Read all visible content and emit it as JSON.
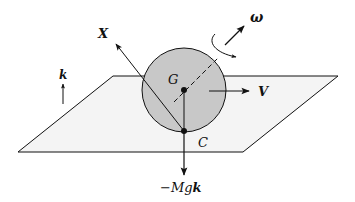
{
  "diagram": {
    "colors": {
      "plane_fill": "#f4f4f4",
      "sphere_fill": "#c8c8c8",
      "stroke": "#111111",
      "background": "#ffffff"
    },
    "labels": {
      "x_axis": "X",
      "omega": "ω",
      "velocity": "V",
      "center": "G",
      "contact": "C",
      "k_vector": "k",
      "weight_prefix": "−Mg",
      "weight_vector": "k"
    },
    "elements": [
      {
        "name": "plane",
        "type": "parallelogram"
      },
      {
        "name": "sphere",
        "type": "circle",
        "center_label": "G"
      },
      {
        "name": "contact-point",
        "label": "C"
      },
      {
        "name": "X-axis-arrow",
        "label": "X"
      },
      {
        "name": "rotation-axis",
        "style": "dashed"
      },
      {
        "name": "angular-velocity-arrow",
        "label": "ω"
      },
      {
        "name": "velocity-arrow",
        "label": "V"
      },
      {
        "name": "k-unit-vector-arrow",
        "label": "k"
      },
      {
        "name": "weight-arrow",
        "label": "−Mgk"
      }
    ]
  }
}
